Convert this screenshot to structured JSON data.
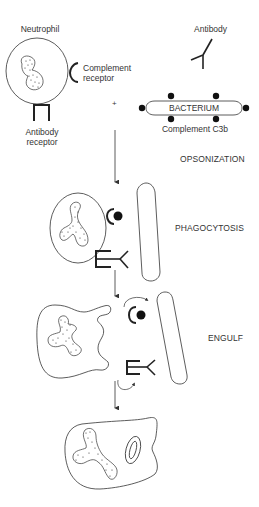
{
  "diagram": {
    "labels": {
      "neutrophil": "Neutrophil",
      "complement_receptor_line1": "Complement",
      "complement_receptor_line2": "receptor",
      "antibody_receptor_line1": "Antibody",
      "antibody_receptor_line2": "receptor",
      "antibody": "Antibody",
      "bacterium": "BACTERIUM",
      "complement_c3b": "Complement C3b",
      "plus": "+"
    },
    "stages": [
      {
        "label": "OPSONIZATION"
      },
      {
        "label": "PHAGOCYTOSIS"
      },
      {
        "label": "ENGULF"
      }
    ],
    "colors": {
      "line": "#333333",
      "text": "#333333",
      "background": "#ffffff"
    }
  }
}
